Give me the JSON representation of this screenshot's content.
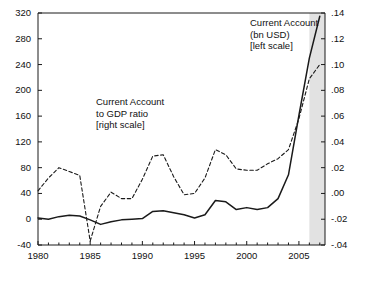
{
  "chart_data": {
    "type": "line",
    "title": "",
    "subtitle": "",
    "xlabel": "",
    "ylabel": "",
    "grid": false,
    "legend_position": "inline-annotations",
    "x": [
      1980,
      1981,
      1982,
      1983,
      1984,
      1985,
      1986,
      1987,
      1988,
      1989,
      1990,
      1991,
      1992,
      1993,
      1994,
      1995,
      1996,
      1997,
      1998,
      1999,
      2000,
      2001,
      2002,
      2003,
      2004,
      2005,
      2006,
      2007
    ],
    "x_axis": {
      "min": 1980,
      "max": 2007.5,
      "tick_labels": [
        "1980",
        "1985",
        "1990",
        "1995",
        "2000",
        "2005"
      ],
      "tick_values": [
        1980,
        1985,
        1990,
        1995,
        2000,
        2005
      ],
      "minor_tick_step": 1
    },
    "left_axis": {
      "label": "Current Account (bn USD)",
      "min": -40,
      "max": 320,
      "tick_labels": [
        "320",
        "280",
        "240",
        "200",
        "160",
        "120",
        "80",
        "40",
        "0",
        "-40"
      ],
      "tick_values": [
        320,
        280,
        240,
        200,
        160,
        120,
        80,
        40,
        0,
        -40
      ]
    },
    "right_axis": {
      "label": "Current Account to GDP ratio",
      "min": -0.04,
      "max": 0.14,
      "tick_labels": [
        ".14",
        ".12",
        ".10",
        ".08",
        ".06",
        ".04",
        ".02",
        ".00",
        "-.02",
        "-.04"
      ],
      "tick_values": [
        0.14,
        0.12,
        0.1,
        0.08,
        0.06,
        0.04,
        0.02,
        0.0,
        -0.02,
        -0.04
      ]
    },
    "shaded_band": {
      "name": "forecast-band",
      "x_start": 2006.0,
      "x_end": 2007.5,
      "color": "#e2e2e2"
    },
    "series": [
      {
        "name": "Current Account (bn USD)",
        "axis": "left",
        "style": "solid",
        "color": "#1a1a1a",
        "values": [
          2,
          0,
          4,
          6,
          5,
          -1,
          -8,
          -4,
          -1,
          0,
          1,
          12,
          13,
          10,
          7,
          2,
          7,
          29,
          27,
          15,
          18,
          15,
          18,
          32,
          69,
          161,
          250,
          315
        ]
      },
      {
        "name": "Current Account to GDP ratio",
        "axis": "right",
        "style": "dashed",
        "color": "#1a1a1a",
        "values": [
          0.002,
          0.012,
          0.02,
          0.017,
          0.014,
          -0.037,
          -0.01,
          0.001,
          -0.004,
          -0.004,
          0.011,
          0.029,
          0.03,
          0.013,
          -0.001,
          0.0,
          0.012,
          0.034,
          0.03,
          0.019,
          0.018,
          0.018,
          0.023,
          0.027,
          0.034,
          0.058,
          0.089,
          0.1
        ]
      }
    ],
    "annotations": [
      {
        "name": "current-account-level-annotation",
        "lines": [
          "Current Account",
          "(bn USD)",
          "[left scale]"
        ]
      },
      {
        "name": "current-account-ratio-annotation",
        "lines": [
          "Current Account",
          "to GDP ratio",
          "[right scale]"
        ]
      }
    ]
  }
}
